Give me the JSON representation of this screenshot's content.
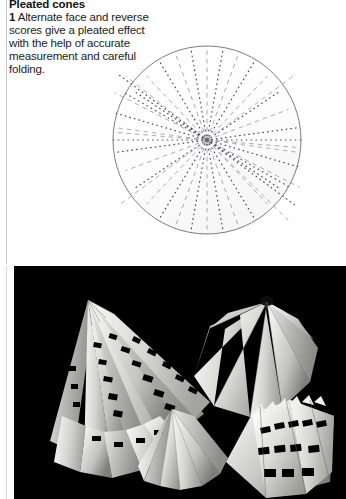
{
  "page": {
    "width": 346,
    "height": 499,
    "background": "#ffffff",
    "rule_color": "#c9c9c9"
  },
  "article": {
    "title": "Pleated cones",
    "step_number": "1",
    "body": " Alternate face and reverse scores give a pleated effect with the help of accurate measurement and careful folding."
  },
  "diagram": {
    "name": "pleated-cone-scoring-template",
    "type": "radial-score-circle",
    "center_x": 207,
    "center_y": 140,
    "radius": 94,
    "outline_color": "#6e6e6e",
    "dash_line_color": "#9a9aa2",
    "dot_line_color": "#4a4a52",
    "radial_line_count": 36,
    "pattern": "alternating dashed (valley) and dotted (mountain) radial score lines",
    "shadow": true
  },
  "photo": {
    "name": "pleated-cone-models-photograph",
    "background": "#000000",
    "border_color": "#ffffff",
    "caption": "",
    "models": [
      {
        "name": "tall-pleated-cone-with-cut-slots",
        "position": "left",
        "description": "Tall white paper pleated cone with rows of punched rectangular slots"
      },
      {
        "name": "wide-pleated-cone-smooth",
        "position": "top-right",
        "description": "Wide smooth white pleated cone viewed from above with dark apex knot"
      },
      {
        "name": "small-pleated-cone",
        "position": "bottom-center",
        "description": "Small plain white pleated fan cone"
      },
      {
        "name": "flat-pleated-fan-with-cuts",
        "position": "bottom-right",
        "description": "Flattened pleated fan segment with serrated cut edges"
      }
    ]
  }
}
